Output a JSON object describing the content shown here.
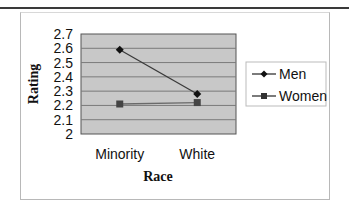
{
  "chart_data": {
    "type": "line",
    "title": "",
    "xlabel": "Race",
    "ylabel": "Rating",
    "categories": [
      "Minority",
      "White"
    ],
    "series": [
      {
        "name": "Men",
        "marker": "diamond",
        "values": [
          2.59,
          2.28
        ]
      },
      {
        "name": "Women",
        "marker": "square",
        "values": [
          2.21,
          2.22
        ]
      }
    ],
    "ylim": [
      2,
      2.7
    ],
    "yticks": [
      "2",
      "2.1",
      "2.2",
      "2.3",
      "2.4",
      "2.5",
      "2.6",
      "2.7"
    ],
    "grid": true,
    "legend_position": "right",
    "colors": {
      "plot_background": "#c8c8c8",
      "gridline": "#7a7a7a",
      "men_line": "#3a3a3a",
      "women_line": "#6a6a6a"
    }
  }
}
